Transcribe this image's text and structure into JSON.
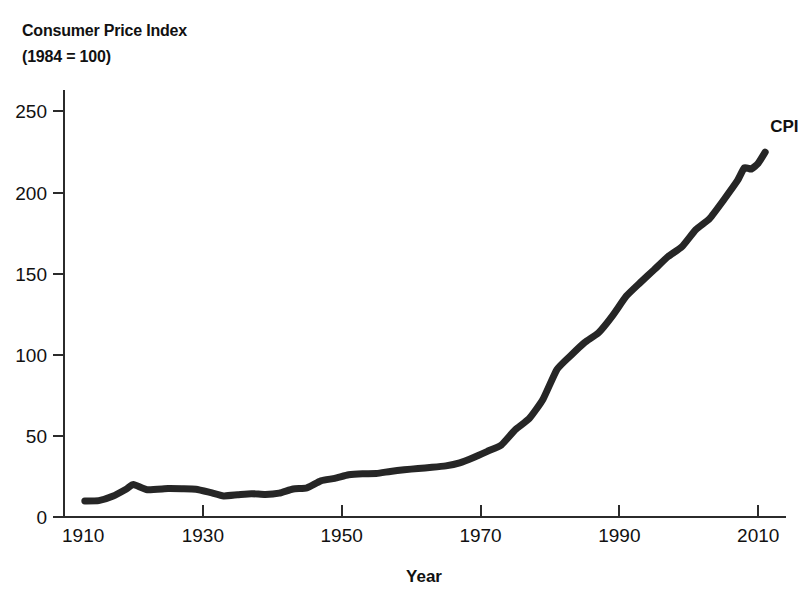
{
  "chart_data": {
    "type": "line",
    "title": "Consumer Price Index",
    "subtitle": "(1984 = 100)",
    "xlabel": "Year",
    "ylabel": "",
    "xlim": [
      1910,
      2014
    ],
    "ylim": [
      0,
      262
    ],
    "grid": false,
    "legend_position": "inline-right-end",
    "x_ticks": [
      1910,
      1930,
      1950,
      1970,
      1990,
      2010
    ],
    "x_tick_labels": [
      "1910",
      "1930",
      "1950",
      "1970",
      "1990",
      "2010"
    ],
    "y_ticks": [
      0,
      50,
      100,
      150,
      200,
      250
    ],
    "y_tick_labels": [
      "0",
      "50",
      "100",
      "150",
      "200",
      "250"
    ],
    "series": [
      {
        "name": "CPI",
        "label": "CPI",
        "color": "#262626",
        "x": [
          1913,
          1915,
          1917,
          1919,
          1920,
          1922,
          1925,
          1927,
          1929,
          1931,
          1933,
          1935,
          1937,
          1939,
          1941,
          1943,
          1945,
          1947,
          1949,
          1951,
          1953,
          1955,
          1957,
          1959,
          1961,
          1963,
          1965,
          1967,
          1969,
          1971,
          1973,
          1975,
          1977,
          1979,
          1981,
          1983,
          1985,
          1987,
          1989,
          1991,
          1993,
          1995,
          1997,
          1999,
          2001,
          2003,
          2005,
          2007,
          2008,
          2009,
          2010,
          2011
        ],
        "values": [
          9.9,
          10.1,
          12.8,
          17.3,
          20.0,
          16.8,
          17.5,
          17.4,
          17.1,
          15.2,
          13.0,
          13.7,
          14.4,
          13.9,
          14.7,
          17.3,
          18.0,
          22.3,
          23.8,
          26.0,
          26.7,
          26.8,
          28.1,
          29.1,
          29.9,
          30.6,
          31.5,
          33.4,
          36.7,
          40.5,
          44.4,
          53.8,
          60.6,
          72.6,
          90.9,
          99.6,
          107.6,
          113.6,
          124.0,
          136.2,
          144.5,
          152.4,
          160.5,
          166.6,
          177.1,
          184.0,
          195.3,
          207.3,
          215.3,
          214.5,
          218.1,
          224.9
        ]
      }
    ]
  },
  "figure": {
    "title_line1": "Consumer Price Index",
    "title_line2": "(1984 = 100)",
    "x_axis_caption": "Year",
    "series_callout": "CPI",
    "line_color": "#262626",
    "axis_color": "#2b2b2b",
    "background_color": "#ffffff"
  }
}
